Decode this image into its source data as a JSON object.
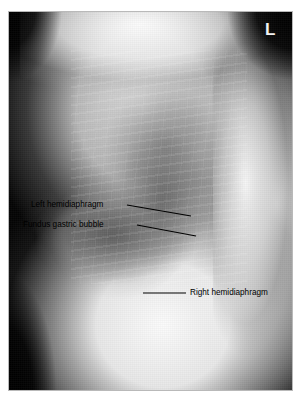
{
  "figure": {
    "type": "lateral-chest-radiograph",
    "frame_border_color": "#b9b9b9",
    "background_color": "#ffffff",
    "annotation_text_color": "#000000",
    "marker_color": "#f2f2f2"
  },
  "radiograph": {
    "laterality_marker": "L"
  },
  "annotations": [
    {
      "id": "left-hemidiaphragm",
      "label": "Left hemidiaphragm",
      "leader": {
        "x1": 127,
        "y1": 205,
        "x2": 191,
        "y2": 216
      }
    },
    {
      "id": "fundus-gastric-bubble",
      "label": "Fundus gastric bubble",
      "leader": {
        "x1": 137,
        "y1": 225,
        "x2": 196,
        "y2": 236
      }
    },
    {
      "id": "right-hemidiaphragm",
      "label": "Right hemidiaphragm",
      "leader": {
        "x1": 143,
        "y1": 293,
        "x2": 186,
        "y2": 293
      }
    }
  ]
}
